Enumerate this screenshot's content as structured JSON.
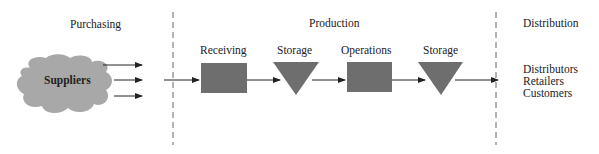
{
  "sections": {
    "purchasing": "Purchasing",
    "production": "Production",
    "distribution": "Distribution"
  },
  "nodes": {
    "suppliers": "Suppliers",
    "receiving": "Receiving",
    "storage1": "Storage",
    "operations": "Operations",
    "storage2": "Storage"
  },
  "distribution_list": [
    "Distributors",
    "Retailers",
    "Customers"
  ],
  "colors": {
    "shape_fill": "#6e6e6e",
    "cloud_fill": "#a9a9a9",
    "line": "#222222",
    "divider": "#555555"
  }
}
